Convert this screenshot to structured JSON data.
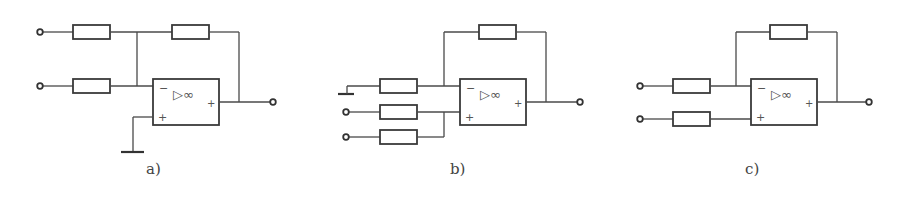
{
  "figure": {
    "diagrams": [
      {
        "id": "a",
        "label": "a)",
        "description": "Inverting summing amplifier: two inputs through resistors to inverting input, feedback resistor, non-inverting input grounded"
      },
      {
        "id": "b",
        "label": "b)",
        "description": "Non-inverting summing amplifier: inverting input resistor to ground, feedback resistor, two inputs through resistors to non-inverting input"
      },
      {
        "id": "c",
        "label": "c)",
        "description": "Differential (subtractor) amplifier: one input through resistor to inverting input, one input through resistor to non-inverting input, feedback resistor"
      }
    ],
    "opamp": {
      "symbol": "▷∞",
      "minus_sign": "−",
      "plus_sign": "+"
    }
  }
}
